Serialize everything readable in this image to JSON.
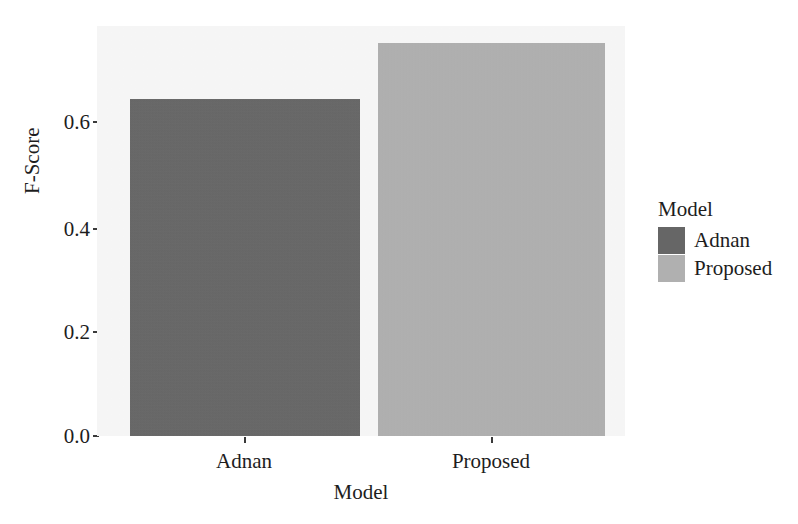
{
  "chart_data": {
    "type": "bar",
    "title": "",
    "subtitle": "",
    "xlabel": "Model",
    "ylabel": "F-Score",
    "categories": [
      "Adnan",
      "Proposed"
    ],
    "values": [
      0.645,
      0.753
    ],
    "series": [
      {
        "name": "F-Score",
        "values": [
          0.645,
          0.753
        ]
      }
    ],
    "xtick_labels": [
      "Adnan",
      "Proposed"
    ],
    "ytick_labels": [
      "0.0",
      "0.2",
      "0.4",
      "0.6"
    ],
    "ytick_values": [
      0.0,
      0.2,
      0.4,
      0.6
    ],
    "ylim": [
      0.0,
      0.785
    ],
    "grid": false,
    "legend": {
      "title": "Model",
      "position": "right",
      "entries": [
        {
          "label": "Adnan",
          "color": "#666666"
        },
        {
          "label": "Proposed",
          "color": "#b0b0b0"
        }
      ]
    },
    "colors": {
      "adnan_bar": "#666666",
      "proposed_bar": "#b0b0b0",
      "panel_background": "#f7f7f7",
      "page_background": "#ffffff",
      "axis_text": "#1d1d1d"
    }
  }
}
